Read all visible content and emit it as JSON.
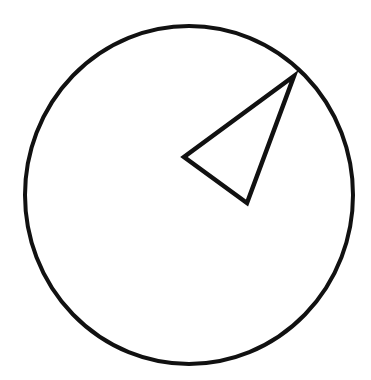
{
  "diagram": {
    "background": "#ffffff",
    "stroke_color": "#111111",
    "circle": {
      "cx": 189,
      "cy": 195,
      "rx": 164,
      "ry": 169,
      "stroke_width": 4
    },
    "triangle": {
      "points": "294,76 184,157 247,203",
      "stroke_width": 4.5
    }
  }
}
